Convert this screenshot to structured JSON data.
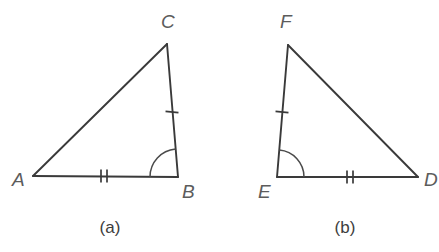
{
  "figure": {
    "background_color": "#ffffff",
    "line_color": "#3a3a3a",
    "label_color": "#5c5c5c",
    "caption_color": "#3d3d3d",
    "panels": [
      {
        "caption": "(a)",
        "caption_x": 110,
        "caption_y": 233,
        "vertices": [
          {
            "name": "A",
            "x": 33,
            "y": 176,
            "label": "A",
            "label_x": 12,
            "label_y": 186
          },
          {
            "name": "B",
            "x": 178,
            "y": 177,
            "label": "B",
            "label_x": 182,
            "label_y": 198
          },
          {
            "name": "C",
            "x": 167,
            "y": 44,
            "label": "C",
            "label_x": 161,
            "label_y": 28
          }
        ],
        "edges": [
          {
            "name": "AB",
            "from": "A",
            "to": "B"
          },
          {
            "name": "BC",
            "from": "B",
            "to": "C"
          },
          {
            "name": "CA",
            "from": "C",
            "to": "A"
          }
        ],
        "tick_marks": [
          {
            "name": "tick-single-BC",
            "edge": "BC",
            "count": 1,
            "cx": 172,
            "cy": 112,
            "angle": -85
          },
          {
            "name": "tick-double-AB",
            "edge": "AB",
            "count": 2,
            "cx": 104,
            "cy": 176,
            "angle": 0
          }
        ],
        "angle_marks": [
          {
            "name": "angle-arc-B",
            "vertex": "B",
            "radius": 28,
            "start_deg": 180,
            "end_deg": 265
          }
        ]
      },
      {
        "caption": "(b)",
        "caption_x": 345,
        "caption_y": 233,
        "vertices": [
          {
            "name": "E",
            "x": 277,
            "y": 177,
            "label": "E",
            "label_x": 258,
            "label_y": 198
          },
          {
            "name": "D",
            "x": 418,
            "y": 177,
            "label": "D",
            "label_x": 424,
            "label_y": 186
          },
          {
            "name": "F",
            "x": 288,
            "y": 45,
            "label": "F",
            "label_x": 280,
            "label_y": 28
          }
        ],
        "edges": [
          {
            "name": "ED",
            "from": "E",
            "to": "D"
          },
          {
            "name": "DF",
            "from": "D",
            "to": "F"
          },
          {
            "name": "FE",
            "from": "F",
            "to": "E"
          }
        ],
        "tick_marks": [
          {
            "name": "tick-single-EF",
            "edge": "FE",
            "count": 1,
            "cx": 282,
            "cy": 112,
            "angle": -85
          },
          {
            "name": "tick-double-ED",
            "edge": "ED",
            "count": 2,
            "cx": 350,
            "cy": 177,
            "angle": 0
          }
        ],
        "angle_marks": [
          {
            "name": "angle-arc-E",
            "vertex": "E",
            "radius": 27,
            "start_deg": 275,
            "end_deg": 360
          }
        ]
      }
    ]
  }
}
